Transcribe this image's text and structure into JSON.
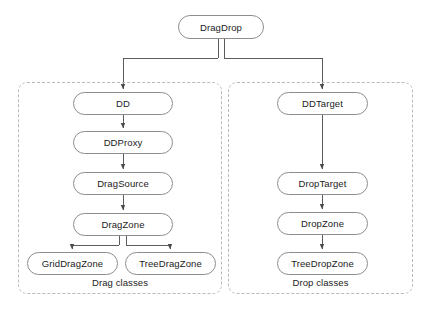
{
  "diagram": {
    "title_node": {
      "label": "DragDrop",
      "x": 178,
      "y": 15,
      "w": 86,
      "h": 24
    },
    "groups": [
      {
        "name": "drag-group",
        "label": "Drag classes",
        "x": 18,
        "y": 82,
        "w": 204,
        "h": 212,
        "label_x": 18,
        "label_y": 277,
        "label_w": 204
      },
      {
        "name": "drop-group",
        "label": "Drop classes",
        "x": 228,
        "y": 82,
        "w": 185,
        "h": 212,
        "label_x": 228,
        "label_y": 277,
        "label_w": 185
      }
    ],
    "nodes": [
      {
        "id": "dd",
        "label": "DD",
        "x": 73,
        "y": 92,
        "w": 100,
        "h": 23
      },
      {
        "id": "ddproxy",
        "label": "DDProxy",
        "x": 73,
        "y": 131,
        "w": 100,
        "h": 23
      },
      {
        "id": "dragsource",
        "label": "DragSource",
        "x": 73,
        "y": 172,
        "w": 100,
        "h": 23
      },
      {
        "id": "dragzone",
        "label": "DragZone",
        "x": 73,
        "y": 213,
        "w": 100,
        "h": 23
      },
      {
        "id": "griddragzone",
        "label": "GridDragZone",
        "x": 27,
        "y": 252,
        "w": 91,
        "h": 23
      },
      {
        "id": "treedragzone",
        "label": "TreeDragZone",
        "x": 125,
        "y": 252,
        "w": 91,
        "h": 23
      },
      {
        "id": "ddtarget",
        "label": "DDTarget",
        "x": 277,
        "y": 92,
        "w": 91,
        "h": 23
      },
      {
        "id": "droptarget",
        "label": "DropTarget",
        "x": 277,
        "y": 172,
        "w": 91,
        "h": 23
      },
      {
        "id": "dropzone",
        "label": "DropZone",
        "x": 277,
        "y": 212,
        "w": 91,
        "h": 23
      },
      {
        "id": "treedropzone",
        "label": "TreeDropZone",
        "x": 277,
        "y": 252,
        "w": 91,
        "h": 23
      }
    ],
    "colors": {
      "node_border": "#8d8d8d",
      "node_fill": "#ffffff",
      "group_border": "#b9b9b9",
      "connector": "#4a4a4a",
      "text": "#1b1b1b"
    },
    "connectors": [
      {
        "from": "DragDrop",
        "to": "DD",
        "style": "elbow-left-arrow"
      },
      {
        "from": "DragDrop",
        "to": "DDTarget",
        "style": "elbow-right-arrow"
      },
      {
        "from": "DD",
        "to": "DDProxy",
        "style": "straight-arrow"
      },
      {
        "from": "DDProxy",
        "to": "DragSource",
        "style": "straight-arrow"
      },
      {
        "from": "DragSource",
        "to": "DragZone",
        "style": "straight-arrow"
      },
      {
        "from": "DragZone",
        "to": "GridDragZone",
        "style": "elbow-left-arrow"
      },
      {
        "from": "DragZone",
        "to": "TreeDragZone",
        "style": "elbow-right-arrow"
      },
      {
        "from": "DDTarget",
        "to": "DropTarget",
        "style": "straight-arrow"
      },
      {
        "from": "DropTarget",
        "to": "DropZone",
        "style": "straight-arrow"
      },
      {
        "from": "DropZone",
        "to": "TreeDropZone",
        "style": "straight-arrow"
      }
    ]
  }
}
